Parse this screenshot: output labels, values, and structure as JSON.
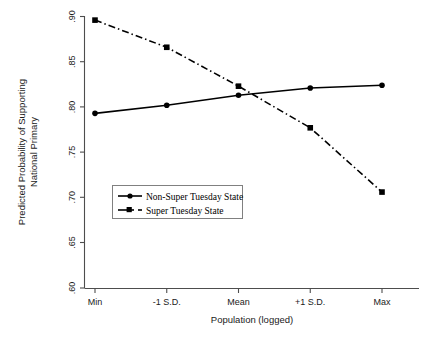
{
  "chart_data": {
    "type": "line",
    "title": "",
    "xlabel": "Population (logged)",
    "ylabel": "Predicted Probability of Supporting National Primary",
    "ylabel_line1": "Predicted Probability of Supporting",
    "ylabel_line2": "National Primary",
    "categories": [
      "Min",
      "-1 S.D.",
      "Mean",
      "+1 S.D.",
      "Max"
    ],
    "ylim": [
      0.6,
      0.9
    ],
    "yticks": [
      0.6,
      0.65,
      0.7,
      0.75,
      0.8,
      0.85,
      0.9
    ],
    "ytick_labels": [
      ".60",
      ".65",
      ".70",
      ".75",
      ".80",
      ".85",
      ".90"
    ],
    "grid": false,
    "legend_position": "center-left-inside",
    "series": [
      {
        "name": "Non-Super Tuesday State",
        "values": [
          0.793,
          0.802,
          0.813,
          0.821,
          0.824
        ],
        "line_style": "solid",
        "marker": "circle",
        "color": "#000000"
      },
      {
        "name": "Super Tuesday State",
        "values": [
          0.896,
          0.866,
          0.823,
          0.777,
          0.706
        ],
        "line_style": "dash-dot",
        "marker": "square",
        "color": "#000000"
      }
    ]
  },
  "legend": {
    "items": [
      {
        "label": "Non-Super Tuesday State"
      },
      {
        "label": "Super Tuesday State"
      }
    ]
  },
  "axes": {
    "x_title": "Population (logged)",
    "y_title_line1": "Predicted Probability of Supporting",
    "y_title_line2": "National Primary",
    "x_tick_labels": [
      "Min",
      "-1 S.D.",
      "Mean",
      "+1 S.D.",
      "Max"
    ],
    "y_tick_labels": [
      ".90",
      ".85",
      ".80",
      ".75",
      ".70",
      ".65",
      ".60"
    ]
  }
}
